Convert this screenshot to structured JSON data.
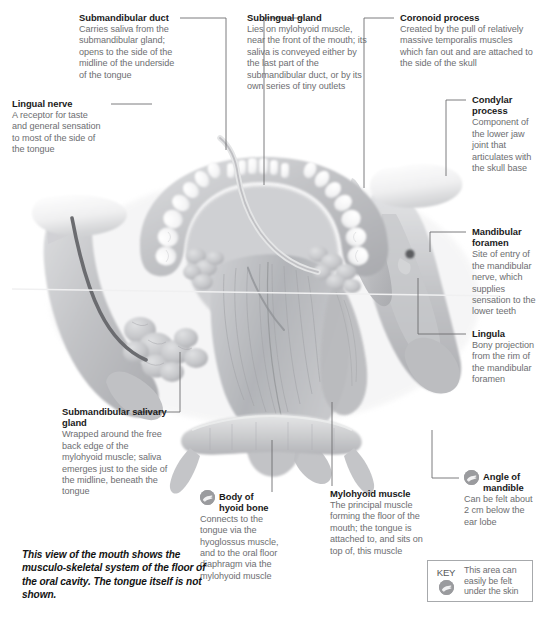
{
  "figure": {
    "caption": "This view of the mouth shows the musculo-skeletal system of the floor of the oral cavity. The tongue itself is not shown.",
    "key": {
      "word": "KEY",
      "text": "This area can easily be felt under the skin",
      "icon": "touch-hand-icon"
    }
  },
  "annotations": {
    "submandibular_duct": {
      "title": "Submandibular duct",
      "body": "Carries saliva from the submandibular gland; opens to the side of the midline of the underside of the tongue"
    },
    "lingual_nerve": {
      "title": "Lingual nerve",
      "body": "A receptor for taste and general sensation to most of the side of the tongue"
    },
    "sublingual_gland": {
      "title": "Sublingual gland",
      "body": "Lies on mylohyoid muscle, near the front of the mouth; its saliva is conveyed either by the last part of the submandibular duct, or by its own series of tiny outlets"
    },
    "coronoid_process": {
      "title": "Coronoid process",
      "body": "Created by the pull of relatively massive temporalis muscles which fan out and are attached to the side of the skull"
    },
    "condylar_process": {
      "title": "Condylar process",
      "body": "Component of the lower jaw joint that articulates with the skull base"
    },
    "mandibular_foramen": {
      "title": "Mandibular foramen",
      "body": "Site of entry of the mandibular nerve, which supplies sensation to the lower teeth"
    },
    "lingula": {
      "title": "Lingula",
      "body": "Bony projection from the rim of the mandibular foramen"
    },
    "angle_of_mandible": {
      "title": "Angle of mandible",
      "body": "Can be felt about 2 cm below the ear lobe",
      "icon": "touch-hand-icon"
    },
    "mylohyoid_muscle": {
      "title": "Mylohyoid muscle",
      "body": "The principal muscle forming the floor of the mouth; the tongue is attached to, and sits on top of, this muscle"
    },
    "body_of_hyoid_bone": {
      "title": "Body of hyoid bone",
      "body": "Connects to the tongue via the hyoglossus muscle, and to the oral floor diaphragm via the mylohyoid muscle",
      "icon": "touch-hand-icon"
    },
    "submandibular_salivary_gland": {
      "title": "Submandibular salivary gland",
      "body": "Wrapped around the free back edge of the mylohyoid muscle; saliva emerges just to the side of the midline, beneath the tongue"
    }
  },
  "colors": {
    "bone": "#b9babd",
    "bone_light": "#d7d8da",
    "tooth": "#fdfdfd",
    "gland": "#c5c6c9",
    "muscle": "#b3b5b8",
    "nerve": "#6b6c70",
    "leader": "#6d6e71",
    "body_text": "#6d6e71",
    "title_text": "#1a1a1a",
    "badge": "#9a9b9e"
  }
}
